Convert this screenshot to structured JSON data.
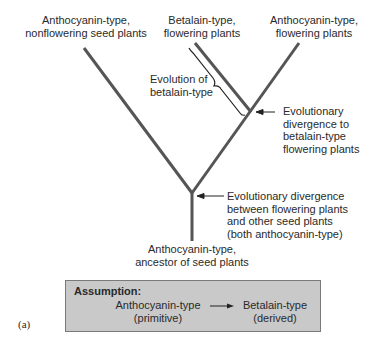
{
  "diagram": {
    "type": "phylogenetic-tree",
    "tips": {
      "left": [
        "Anthocyanin-type,",
        "nonflowering seed plants"
      ],
      "middle": [
        "Betalain-type,",
        "flowering plants"
      ],
      "right": [
        "Anthocyanin-type,",
        "flowering plants"
      ]
    },
    "root": [
      "Anthocyanin-type,",
      "ancestor of seed plants"
    ],
    "annotations": {
      "bracket": [
        "Evolution of",
        "betalain-type"
      ],
      "upper_divergence": [
        "Evolutionary",
        "divergence to",
        "betalain-type",
        "flowering plants"
      ],
      "lower_divergence": [
        "Evolutionary divergence",
        "between flowering plants",
        "and other seed plants",
        "(both anthocyanin-type)"
      ]
    },
    "assumption_box": {
      "title": "Assumption:",
      "from": [
        "Anthocyanin-type",
        "(primitive)"
      ],
      "to": [
        "Betalain-type",
        "(derived)"
      ]
    },
    "panel_label": "(a)",
    "colors": {
      "branch": "#555555",
      "box_fill": "#c9c9c9",
      "box_border": "#7a7a7a",
      "text": "#2a2a2a"
    }
  }
}
